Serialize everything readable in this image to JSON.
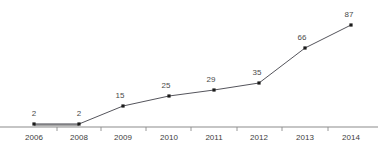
{
  "chart_data": {
    "type": "line",
    "title": "",
    "subtitle": "",
    "xlabel": "",
    "ylabel": "",
    "categories": [
      "2006",
      "2008",
      "2009",
      "2010",
      "2011",
      "2012",
      "2013",
      "2014"
    ],
    "values": [
      2,
      2,
      15,
      25,
      29,
      35,
      66,
      87
    ],
    "series": [
      {
        "name": "",
        "values": [
          2,
          2,
          15,
          25,
          29,
          35,
          66,
          87
        ]
      }
    ],
    "data_labels": [
      "2",
      "2",
      "15",
      "25",
      "29",
      "35",
      "66",
      "87"
    ],
    "ylim": [
      0,
      95
    ],
    "xlim": [
      0,
      7
    ],
    "grid": false,
    "legend": false,
    "legend_position": "none",
    "markers": true,
    "y_axis_visible": false,
    "x_axis_visible": true,
    "colors": {
      "line": "#55555c",
      "marker": "#1b1b1b",
      "axis": "#8c8c8c",
      "value_label": "#4a4a4a",
      "tick_label": "#3d3d3d",
      "background": "#ffffff",
      "title": "#f2f2f2"
    },
    "points": [
      {
        "category": "2006",
        "value": 2,
        "label": "2",
        "px": 34,
        "py": 124,
        "label_x": 34,
        "label_y": 116
      },
      {
        "category": "2008",
        "value": 2,
        "label": "2",
        "px": 79,
        "py": 124,
        "label_x": 79,
        "label_y": 116
      },
      {
        "category": "2009",
        "value": 15,
        "label": "15",
        "px": 123,
        "py": 106,
        "label_x": 120,
        "label_y": 98
      },
      {
        "category": "2010",
        "value": 25,
        "label": "25",
        "px": 169,
        "py": 96,
        "label_x": 166,
        "label_y": 88
      },
      {
        "category": "2011",
        "value": 29,
        "label": "29",
        "px": 214,
        "py": 90,
        "label_x": 211,
        "label_y": 82
      },
      {
        "category": "2012",
        "value": 35,
        "label": "35",
        "px": 259,
        "py": 83,
        "label_x": 257,
        "label_y": 75
      },
      {
        "category": "2013",
        "value": 66,
        "label": "66",
        "px": 305,
        "py": 48,
        "label_x": 302,
        "label_y": 40
      },
      {
        "category": "2014",
        "value": 87,
        "label": "87",
        "px": 351,
        "py": 25,
        "label_x": 349,
        "label_y": 17
      }
    ],
    "tick_positions": [
      57,
      101,
      146,
      191,
      237,
      282,
      328
    ],
    "axis_y": 127,
    "tick_label_y": 140,
    "tick_label_positions": [
      34,
      79,
      123,
      169,
      214,
      259,
      305,
      351
    ],
    "polyline": "34,124 79,124 123,106 169,96 214,90 259,83 305,48 351,25"
  }
}
